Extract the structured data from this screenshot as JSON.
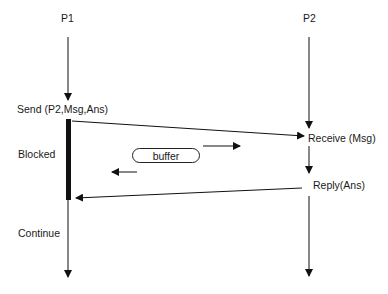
{
  "processes": [
    {
      "id": "p1",
      "label": "P1"
    },
    {
      "id": "p2",
      "label": "P2"
    }
  ],
  "p1_events": {
    "send": "Send (P2,Msg,Ans)",
    "blocked": "Blocked",
    "continue": "Continue"
  },
  "p2_events": {
    "receive": "Receive (Msg)",
    "reply": "Reply(Ans)"
  },
  "buffer": {
    "label": "buffer"
  },
  "messages": [
    {
      "from": "P1",
      "to": "P2",
      "kind": "send"
    },
    {
      "from": "P2",
      "to": "P1",
      "kind": "reply"
    }
  ]
}
